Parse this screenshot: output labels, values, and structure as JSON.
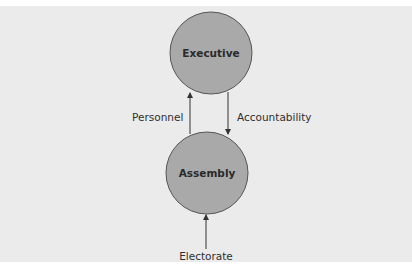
{
  "diagram": {
    "type": "flow",
    "colors": {
      "background": "#ebebeb",
      "node_fill": "#a9a9a9",
      "node_stroke": "#555555",
      "arrow": "#333333"
    },
    "nodes": [
      {
        "id": "executive",
        "label": "Executive"
      },
      {
        "id": "assembly",
        "label": "Assembly"
      },
      {
        "id": "electorate",
        "label": "Electorate"
      }
    ],
    "edges": [
      {
        "from": "assembly",
        "to": "executive",
        "label": "Personnel"
      },
      {
        "from": "executive",
        "to": "assembly",
        "label": "Accountability"
      },
      {
        "from": "electorate",
        "to": "assembly",
        "label": ""
      }
    ]
  }
}
